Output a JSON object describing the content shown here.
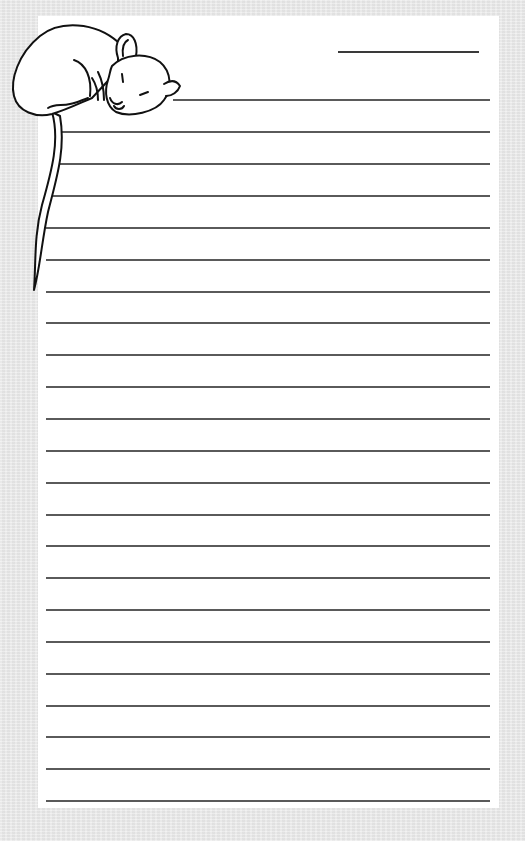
{
  "page": {
    "type": "lined-stationery",
    "background_color": "#e9e9e9",
    "paper_color": "#ffffff",
    "line_color": "#5a5a5a",
    "title_line": {
      "x": 338,
      "y": 51,
      "width": 141
    },
    "lines": [
      {
        "y": 99,
        "x": 173,
        "end": 490
      },
      {
        "y": 131,
        "x": 62,
        "end": 490
      },
      {
        "y": 163,
        "x": 57,
        "end": 490
      },
      {
        "y": 195,
        "x": 46,
        "end": 490
      },
      {
        "y": 227,
        "x": 46,
        "end": 490
      },
      {
        "y": 259,
        "x": 46,
        "end": 490
      },
      {
        "y": 291,
        "x": 46,
        "end": 490
      },
      {
        "y": 322,
        "x": 46,
        "end": 490
      },
      {
        "y": 354,
        "x": 46,
        "end": 490
      },
      {
        "y": 386,
        "x": 46,
        "end": 490
      },
      {
        "y": 418,
        "x": 46,
        "end": 490
      },
      {
        "y": 450,
        "x": 46,
        "end": 490
      },
      {
        "y": 482,
        "x": 46,
        "end": 490
      },
      {
        "y": 514,
        "x": 46,
        "end": 490
      },
      {
        "y": 545,
        "x": 46,
        "end": 490
      },
      {
        "y": 577,
        "x": 46,
        "end": 490
      },
      {
        "y": 609,
        "x": 46,
        "end": 490
      },
      {
        "y": 641,
        "x": 46,
        "end": 490
      },
      {
        "y": 673,
        "x": 46,
        "end": 490
      },
      {
        "y": 705,
        "x": 46,
        "end": 490
      },
      {
        "y": 736,
        "x": 46,
        "end": 490
      },
      {
        "y": 768,
        "x": 46,
        "end": 490
      },
      {
        "y": 800,
        "x": 46,
        "end": 490
      }
    ]
  },
  "illustration": {
    "subject": "sleeping-mouse-icon",
    "description": "Line drawing of a sleeping mouse curled over the top-left corner with its tail hanging down the left margin"
  }
}
